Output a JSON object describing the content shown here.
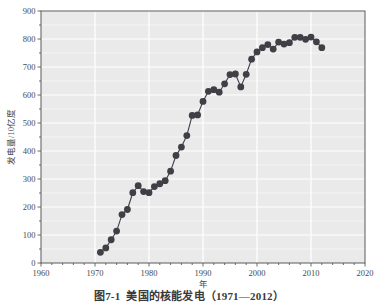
{
  "figure": {
    "caption_number": "图7-1",
    "caption_text": "美国的核能发电（1971—2012）",
    "background_color": "#ffffff",
    "plot_background_color": "#eaeaea",
    "gridline_color": "#ffffff",
    "marker_color": "#3f3f46",
    "axis_color": "#5a5a5a"
  },
  "chart_data": {
    "type": "line",
    "title": "",
    "subtitle": "",
    "xlabel": "年",
    "ylabel": "发电量/10亿度",
    "xlim": [
      1960,
      2020
    ],
    "ylim": [
      0,
      900
    ],
    "xticks": [
      1960,
      1970,
      1980,
      1990,
      2000,
      2010,
      2020
    ],
    "xtick_labels": [
      "1960",
      "1970",
      "1980",
      "1990",
      "2000",
      "2010",
      "2020"
    ],
    "x_minor_tick_step": 2,
    "yticks": [
      0,
      100,
      200,
      300,
      400,
      500,
      600,
      700,
      800,
      900
    ],
    "ytick_labels": [
      "0",
      "100",
      "200",
      "300",
      "400",
      "500",
      "600",
      "700",
      "800",
      "900"
    ],
    "y_minor_tick_step": 50,
    "grid": true,
    "grid_axis": "both",
    "legend_position": "none",
    "marker": "circle",
    "marker_size": 3.4,
    "line_width": 1.1,
    "series": [
      {
        "name": "美国核能发电量",
        "x": [
          1971,
          1972,
          1973,
          1974,
          1975,
          1976,
          1977,
          1978,
          1979,
          1980,
          1981,
          1982,
          1983,
          1984,
          1985,
          1986,
          1987,
          1988,
          1989,
          1990,
          1991,
          1992,
          1993,
          1994,
          1995,
          1996,
          1997,
          1998,
          1999,
          2000,
          2001,
          2002,
          2003,
          2004,
          2005,
          2006,
          2007,
          2008,
          2009,
          2010,
          2011,
          2012
        ],
        "y": [
          38,
          54,
          83,
          114,
          173,
          191,
          251,
          276,
          255,
          251,
          273,
          283,
          294,
          328,
          384,
          414,
          455,
          527,
          529,
          577,
          613,
          619,
          610,
          640,
          673,
          675,
          629,
          674,
          728,
          754,
          769,
          780,
          764,
          789,
          782,
          787,
          806,
          806,
          799,
          807,
          790,
          769
        ]
      }
    ],
    "annotations": []
  }
}
